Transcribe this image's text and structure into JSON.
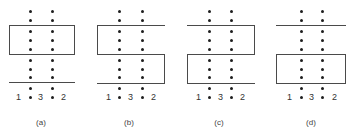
{
  "panels": [
    {
      "id": "a",
      "caption": "(a)",
      "labels": {
        "left": "1",
        "middle": "3",
        "right": "2"
      }
    },
    {
      "id": "b",
      "caption": "(b)",
      "labels": {
        "left": "1",
        "middle": "3",
        "right": "2"
      }
    },
    {
      "id": "c",
      "caption": "(c)",
      "labels": {
        "left": "1",
        "middle": "3",
        "right": "2"
      }
    },
    {
      "id": "d",
      "caption": "(d)",
      "labels": {
        "left": "1",
        "middle": "3",
        "right": "2"
      }
    }
  ],
  "colors": {
    "dot": "#1e1e1e",
    "line": "#4a4a4a",
    "background": "#ffffff"
  }
}
